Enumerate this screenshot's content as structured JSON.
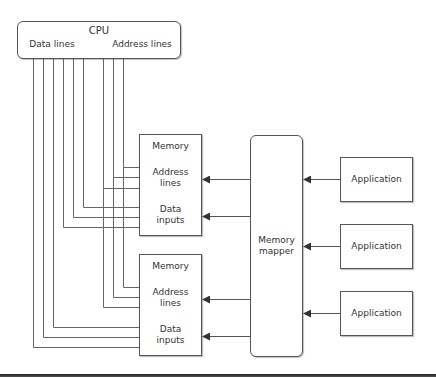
{
  "cpu": {
    "title": "CPU",
    "data_lines_label": "Data lines",
    "address_lines_label": "Address lines"
  },
  "memories": [
    {
      "title": "Memory",
      "address_label_1": "Address",
      "address_label_2": "lines",
      "data_label_1": "Data",
      "data_label_2": "inputs"
    },
    {
      "title": "Memory",
      "address_label_1": "Address",
      "address_label_2": "lines",
      "data_label_1": "Data",
      "data_label_2": "inputs"
    }
  ],
  "mapper": {
    "label_1": "Memory",
    "label_2": "mapper"
  },
  "applications": [
    {
      "label": "Application"
    },
    {
      "label": "Application"
    },
    {
      "label": "Application"
    }
  ],
  "colors": {
    "line": "#555555",
    "text": "#333333",
    "background": "#ffffff"
  }
}
